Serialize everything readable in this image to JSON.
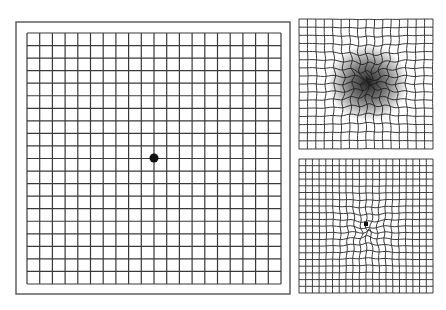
{
  "figure": {
    "panels": [
      {
        "id": "normal",
        "description": "Normal Amsler grid with central fixation dot",
        "columns": 20,
        "rows": 20,
        "has_outer_frame": true,
        "fixation_dot": true
      },
      {
        "id": "central-scotoma",
        "description": "Distorted grid with dark central blur (scotoma)",
        "columns": 16,
        "rows": 16,
        "distortion": "strong",
        "blur": true
      },
      {
        "id": "metamorphopsia",
        "description": "Grid with wavy central lines (metamorphopsia)",
        "columns": 20,
        "rows": 20,
        "distortion": "mild",
        "fixation_dot": true
      }
    ]
  },
  "colors": {
    "background": "#ffffff",
    "grid_line": "#3a3a3a",
    "frame": "#555555",
    "dot": "#111111",
    "blur": "#1a1a1a"
  }
}
